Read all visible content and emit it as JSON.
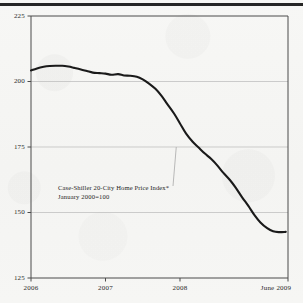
{
  "chart_data": {
    "type": "line",
    "title": "",
    "subtitle": "",
    "xlabel": "",
    "ylabel": "",
    "ylim": [
      125,
      225
    ],
    "xlim": [
      "2006-01",
      "2009-06"
    ],
    "grid": true,
    "legend_position": "none",
    "y_ticks": [
      "225",
      "200",
      "175",
      "150",
      "125"
    ],
    "y_tick_values": [
      225,
      200,
      175,
      150,
      125
    ],
    "x_ticks": [
      "2006",
      "2007",
      "2008",
      "June 2009"
    ],
    "x_tick_values": [
      2006.0,
      2007.0,
      2008.0,
      2009.45
    ],
    "annotations": [
      {
        "line1": "Case-Shiller 20-City Home Price Index*",
        "line2": "January 2000=100",
        "points_to_value": 175,
        "points_to_x": 2007.95
      }
    ],
    "series": [
      {
        "name": "Case-Shiller 20-City Home Price Index",
        "x": [
          2006.0,
          2006.08,
          2006.17,
          2006.25,
          2006.33,
          2006.42,
          2006.5,
          2006.58,
          2006.67,
          2006.75,
          2006.83,
          2006.92,
          2007.0,
          2007.08,
          2007.17,
          2007.25,
          2007.33,
          2007.42,
          2007.5,
          2007.58,
          2007.67,
          2007.75,
          2007.83,
          2007.92,
          2008.0,
          2008.08,
          2008.17,
          2008.25,
          2008.33,
          2008.42,
          2008.5,
          2008.58,
          2008.67,
          2008.75,
          2008.83,
          2008.92,
          2009.0,
          2009.08,
          2009.17,
          2009.25,
          2009.33,
          2009.42
        ],
        "values": [
          204.2,
          205.0,
          205.6,
          205.9,
          206.0,
          206.0,
          205.7,
          205.2,
          204.6,
          204.0,
          203.4,
          203.2,
          203.0,
          202.6,
          202.8,
          202.3,
          202.2,
          201.8,
          200.8,
          199.3,
          197.2,
          194.6,
          191.4,
          187.8,
          184.0,
          180.2,
          177.0,
          174.8,
          172.6,
          170.4,
          168.0,
          165.2,
          162.4,
          159.4,
          156.0,
          152.4,
          149.0,
          146.2,
          144.0,
          142.8,
          142.5,
          142.6
        ]
      }
    ]
  }
}
